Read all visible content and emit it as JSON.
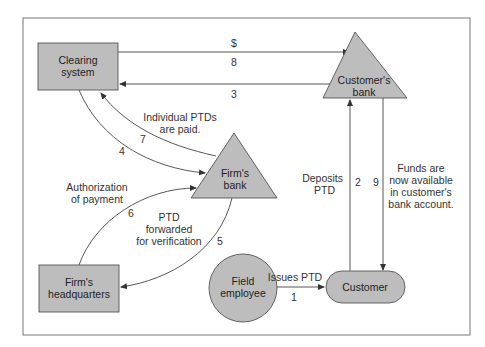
{
  "diagram": {
    "colors": {
      "node_fill": "#bdbdbd",
      "node_stroke": "#555555",
      "line": "#444444",
      "frame": "#777777",
      "background": "#ffffff"
    },
    "nodes": {
      "clearing_system": {
        "line1": "Clearing",
        "line2": "system",
        "shape": "rectangle"
      },
      "customers_bank": {
        "line1": "Customer's",
        "line2": "bank",
        "shape": "triangle"
      },
      "firms_bank": {
        "line1": "Firm's",
        "line2": "bank",
        "shape": "triangle"
      },
      "firms_headquarters": {
        "line1": "Firm's",
        "line2": "headquarters",
        "shape": "rectangle"
      },
      "field_employee": {
        "line1": "Field",
        "line2": "employee",
        "shape": "circle"
      },
      "customer": {
        "line1": "Customer",
        "shape": "rounded-pill"
      }
    },
    "flows": [
      {
        "step": "1",
        "from": "Field employee",
        "to": "Customer",
        "label": [
          "Issues PTD"
        ]
      },
      {
        "step": "2",
        "from": "Customer",
        "to": "Customer's bank",
        "label": [
          "Deposits",
          "PTD"
        ]
      },
      {
        "step": "3",
        "from": "Customer's bank",
        "to": "Clearing system",
        "label": []
      },
      {
        "step": "4",
        "from": "Clearing system",
        "to": "Firm's bank",
        "label": []
      },
      {
        "step": "5",
        "from": "Firm's bank",
        "to": "Firm's headquarters",
        "label": [
          "PTD",
          "forwarded",
          "for verification"
        ]
      },
      {
        "step": "6",
        "from": "Firm's headquarters",
        "to": "Firm's bank",
        "label": [
          "Authorization",
          "of payment"
        ]
      },
      {
        "step": "7",
        "from": "Firm's bank",
        "to": "Clearing system",
        "label": [
          "Individual PTDs",
          "are paid."
        ]
      },
      {
        "step": "8",
        "from": "Clearing system",
        "to": "Customer's bank",
        "label": [
          "$"
        ]
      },
      {
        "step": "9",
        "from": "Customer's bank",
        "to": "Customer",
        "label": [
          "Funds are",
          "now available",
          "in customer's",
          "bank account."
        ]
      }
    ]
  }
}
